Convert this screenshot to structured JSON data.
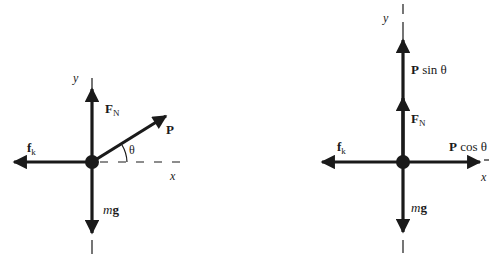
{
  "colors": {
    "ink": "#1a1a1a",
    "background": "#ffffff"
  },
  "left_diagram": {
    "axes": {
      "x_label": "x",
      "y_label": "y"
    },
    "forces": {
      "normal": {
        "symbol": "F",
        "subscript": "N"
      },
      "friction": {
        "symbol": "f",
        "subscript": "k"
      },
      "weight": {
        "prefix": "m",
        "symbol": "g"
      },
      "applied": {
        "symbol": "P"
      }
    },
    "angle_label": "θ"
  },
  "right_diagram": {
    "axes": {
      "x_label": "x",
      "y_label": "y"
    },
    "forces": {
      "applied_vertical": {
        "symbol": "P",
        "text": "sin θ"
      },
      "normal": {
        "symbol": "F",
        "subscript": "N"
      },
      "friction": {
        "symbol": "f",
        "subscript": "k"
      },
      "applied_horizontal": {
        "symbol": "P",
        "text": "cos θ"
      },
      "weight": {
        "prefix": "m",
        "symbol": "g"
      }
    }
  }
}
